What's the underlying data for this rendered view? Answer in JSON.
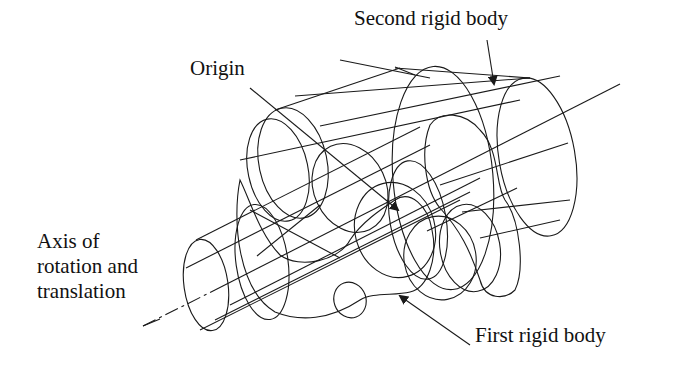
{
  "diagram": {
    "title": "",
    "labels": {
      "second_body": "Second rigid body",
      "origin": "Origin",
      "axis_line1": "Axis of",
      "axis_line2": "rotation and",
      "axis_line3": "translation",
      "first_body": "First rigid body"
    },
    "colors": {
      "stroke": "#1a1a1a",
      "background": "#ffffff",
      "text": "#111111"
    },
    "components": [
      {
        "name": "first-rigid-body",
        "description": "Left cylindrical shaft with lobed flange"
      },
      {
        "name": "second-rigid-body",
        "description": "Right cylindrical shaft with lobed flange"
      },
      {
        "name": "axis",
        "description": "Common axis of rotation and translation, dashed center line"
      },
      {
        "name": "origin",
        "description": "Origin point at center of the assembly"
      }
    ]
  }
}
